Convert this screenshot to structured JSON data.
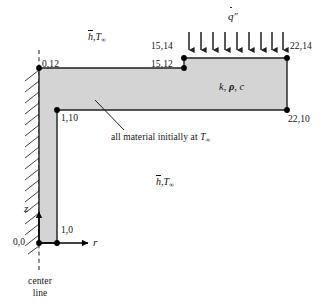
{
  "figure": {
    "body_fill": "#d4d4d4",
    "line_color": "#231f20",
    "node_color": "#000000"
  },
  "node_labels": [
    {
      "id": "n-0-12",
      "text": "0,12"
    },
    {
      "id": "n-15-12",
      "text": "15,12"
    },
    {
      "id": "n-15-14",
      "text": "15,14"
    },
    {
      "id": "n-22-14",
      "text": "22,14"
    },
    {
      "id": "n-22-10",
      "text": "22,10"
    },
    {
      "id": "n-1-10",
      "text": "1,10"
    },
    {
      "id": "n-1-0",
      "text": "1,0"
    },
    {
      "id": "n-0-0",
      "text": "0,0"
    }
  ],
  "annotations": {
    "heat_flux_symbol": "q̇″",
    "material_props": "k, ρ, c",
    "initial_condition": "all material initially at T∞",
    "convection_top": "h̄, T∞",
    "convection_bottom": "h̄, T∞",
    "axis_r": "r",
    "axis_z": "z",
    "center_line_line1": "center",
    "center_line_line2": "line"
  },
  "symbol_parts": {
    "h_bar": "h",
    "T": "T",
    "infinity": "∞",
    "q": "q",
    "double_prime": "″",
    "k": "k",
    "rho": "ρ",
    "c": "c",
    "comma": ", "
  },
  "heat_flux_arrows": {
    "count": 9,
    "direction": "down",
    "x_positions": [
      189,
      201,
      213,
      225,
      237,
      249,
      261,
      273,
      283
    ],
    "y_top": 32,
    "y_bottom": 56
  },
  "geometry": {
    "polygon_points": "39,68 184,68 184,58 287,58 287,110 57,110 57,243 39,243",
    "hatch_edge": {
      "x": 39,
      "y_top": 68,
      "y_bottom": 245
    },
    "center_line": {
      "x": 39,
      "y_top": 50,
      "y_bottom": 272
    }
  }
}
